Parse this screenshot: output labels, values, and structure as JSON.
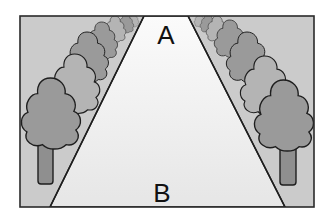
{
  "diagram": {
    "type": "perspective road with tree rows",
    "labels": {
      "far": "A",
      "near": "B"
    },
    "colors": {
      "frame": "#2a2a2a",
      "verge": "#c9c9c9",
      "road": "#efefef",
      "crown_dark": "#9a9a9a",
      "crown_light": "#b4b4b4",
      "trunk": "#8f8f8f",
      "outline": "#1e1e1e"
    },
    "frame": {
      "x": 20,
      "y": 16,
      "width": 294,
      "height": 191
    },
    "road": {
      "top_left_x": 144,
      "top_right_x": 188,
      "bottom_left_x": 50,
      "bottom_right_x": 285
    },
    "trees_per_side": 7
  }
}
